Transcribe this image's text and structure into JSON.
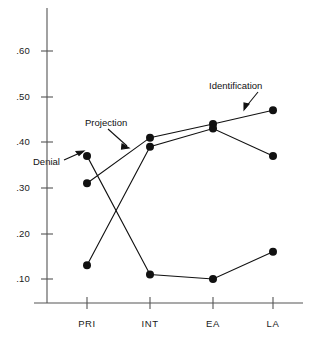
{
  "chart_data": {
    "type": "line",
    "title": "",
    "subtitle": "",
    "xlabel": "",
    "ylabel": "",
    "categories": [
      "PRI",
      "INT",
      "EA",
      "LA"
    ],
    "ytick_labels": [
      ".60",
      ".50",
      ".40",
      ".30",
      ".20",
      ".10"
    ],
    "ytick_values": [
      0.6,
      0.5,
      0.4,
      0.3,
      0.2,
      0.1
    ],
    "ylim": [
      0.0,
      0.655
    ],
    "grid": false,
    "legend_position": "inline-annotations",
    "marker": "filled-circle",
    "line_color": "#111111",
    "marker_color": "#111111",
    "series": [
      {
        "name": "Denial",
        "values": [
          0.37,
          0.11,
          0.1,
          0.16
        ]
      },
      {
        "name": "Projection",
        "values": [
          0.31,
          0.41,
          0.44,
          0.47
        ]
      },
      {
        "name": "Identification",
        "values": [
          0.13,
          0.39,
          0.43,
          0.37
        ]
      }
    ],
    "annotations": [
      {
        "text": "Denial",
        "points_to_series": "Denial",
        "points_to_category": "PRI"
      },
      {
        "text": "Projection",
        "points_to_series": "Projection",
        "points_to_category": "PRI-INT"
      },
      {
        "text": "Identification",
        "points_to_series": "Identification",
        "points_to_category": "EA-LA"
      }
    ]
  },
  "axes": {
    "y": {
      "ticks": [
        {
          "label": ".60",
          "value": 0.6
        },
        {
          "label": ".50",
          "value": 0.5
        },
        {
          "label": ".40",
          "value": 0.4
        },
        {
          "label": ".30",
          "value": 0.3
        },
        {
          "label": ".20",
          "value": 0.2
        },
        {
          "label": ".10",
          "value": 0.1
        }
      ]
    },
    "x": {
      "ticks": [
        {
          "label": "PRI"
        },
        {
          "label": "INT"
        },
        {
          "label": "EA"
        },
        {
          "label": "LA"
        }
      ]
    }
  },
  "annotations": {
    "denial": "Denial",
    "projection": "Projection",
    "identification": "Identification"
  }
}
